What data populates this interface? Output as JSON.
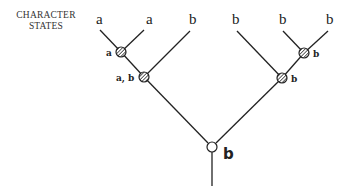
{
  "diagram": {
    "title_line1": "CHARACTER",
    "title_line2": "STATES",
    "tips": [
      "a",
      "a",
      "b",
      "b",
      "b",
      "b"
    ],
    "internal_nodes": [
      {
        "id": "n1",
        "label": "a",
        "style": "hatched"
      },
      {
        "id": "n2",
        "label": "a, b",
        "style": "hatched"
      },
      {
        "id": "n3",
        "label": "b",
        "style": "hatched"
      },
      {
        "id": "n4",
        "label": "b",
        "style": "hatched"
      }
    ],
    "root": {
      "label": "b",
      "style": "open-circle"
    }
  }
}
